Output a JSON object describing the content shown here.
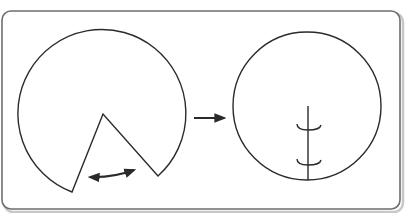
{
  "figure": {
    "colors": {
      "stroke": "#2a2a2a",
      "frame": "#6e6e6e",
      "frame_shadow": "#c8c8c8",
      "background": "#ffffff"
    },
    "left_panel": {
      "shape": "circle-with-wedge-removed",
      "annotation": "double-headed-arrow (close the gap)"
    },
    "transition": {
      "shape": "right-arrow"
    },
    "right_panel": {
      "shape": "circle-with-seam",
      "stitches": 2
    }
  }
}
